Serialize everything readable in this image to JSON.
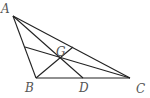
{
  "diagram": {
    "type": "triangle-medians",
    "labels": {
      "A": "A",
      "B": "B",
      "C": "C",
      "D": "D",
      "G": "G"
    },
    "points": {
      "A": [
        13,
        16
      ],
      "B": [
        36,
        78
      ],
      "C": [
        130,
        78
      ],
      "D": [
        83,
        78
      ],
      "G": [
        60,
        58
      ],
      "M_AC": [
        73,
        47
      ],
      "M_AB": [
        25,
        47
      ]
    },
    "segments": [
      [
        "A",
        "B"
      ],
      [
        "A",
        "C"
      ],
      [
        "B",
        "C"
      ],
      [
        "A",
        "D"
      ],
      [
        "B",
        "M_AC"
      ],
      [
        "C",
        "M_AB"
      ]
    ],
    "stroke_color": "#222222",
    "label_color": "#555555"
  }
}
